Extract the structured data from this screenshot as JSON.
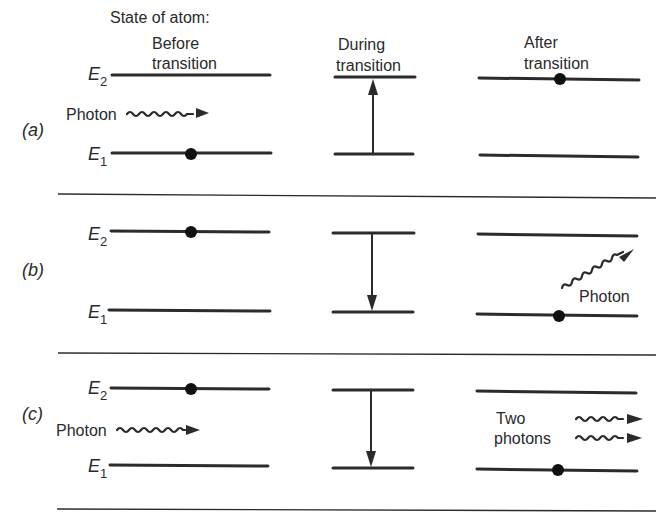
{
  "title": "State of atom:",
  "columns": [
    {
      "label_line1": "Before",
      "label_line2": "transition"
    },
    {
      "label_line1": "During",
      "label_line2": "transition"
    },
    {
      "label_line1": "After",
      "label_line2": "transition"
    }
  ],
  "levels": {
    "upper": "E",
    "upper_sub": "2",
    "lower": "E",
    "lower_sub": "1"
  },
  "panels": [
    {
      "id": "a",
      "label": "(a)",
      "process": "absorption",
      "before": {
        "electron_level": "E1",
        "incoming_photon_label": "Photon"
      },
      "during": {
        "arrow_direction": "up"
      },
      "after": {
        "electron_level": "E2"
      }
    },
    {
      "id": "b",
      "label": "(b)",
      "process": "spontaneous emission",
      "before": {
        "electron_level": "E2"
      },
      "during": {
        "arrow_direction": "down"
      },
      "after": {
        "electron_level": "E1",
        "emitted_photon_label": "Photon"
      }
    },
    {
      "id": "c",
      "label": "(c)",
      "process": "stimulated emission",
      "before": {
        "electron_level": "E2",
        "incoming_photon_label": "Photon"
      },
      "during": {
        "arrow_direction": "down"
      },
      "after": {
        "electron_level": "E1",
        "emitted_photon_label_line1": "Two",
        "emitted_photon_label_line2": "photons"
      }
    }
  ],
  "colors": {
    "ink": "#2b2b2b",
    "background": "#ffffff"
  }
}
